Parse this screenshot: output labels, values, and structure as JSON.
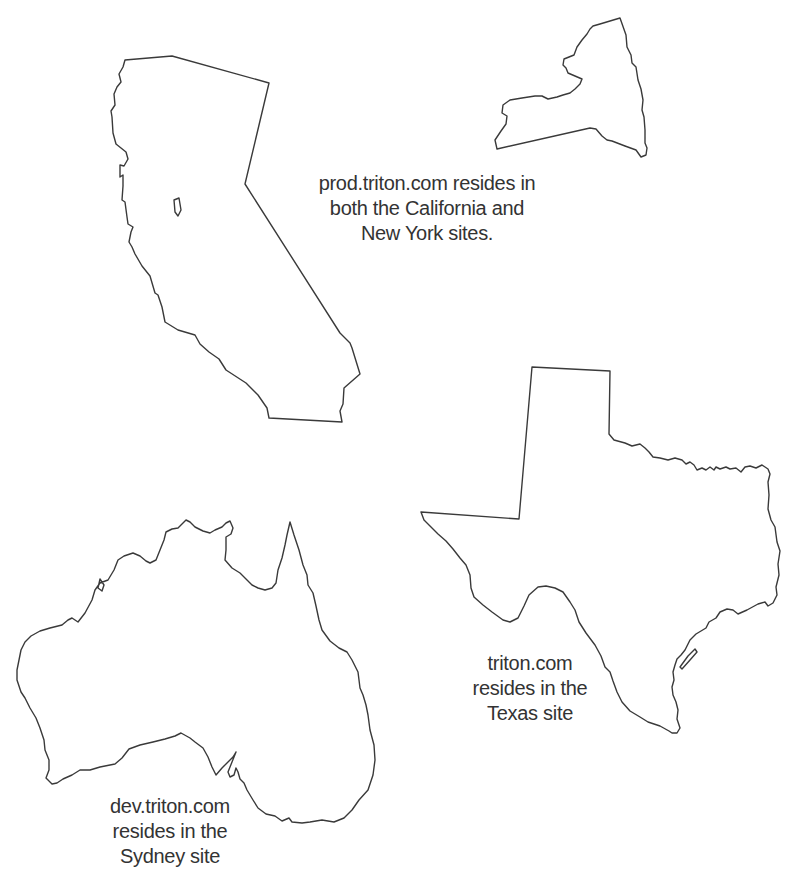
{
  "diagram": {
    "type": "site-map-illustration",
    "regions": [
      {
        "id": "california",
        "name": "California"
      },
      {
        "id": "new-york",
        "name": "New York"
      },
      {
        "id": "texas",
        "name": "Texas"
      },
      {
        "id": "australia",
        "name": "Sydney (Australia)"
      }
    ],
    "labels": {
      "prod": {
        "lines": [
          "prod.triton.com resides in",
          "both the California and",
          "New York sites."
        ]
      },
      "texas": {
        "lines": [
          "triton.com",
          "resides in the",
          "Texas site"
        ]
      },
      "dev": {
        "lines": [
          "dev.triton.com",
          "resides in the",
          "Sydney site"
        ]
      }
    },
    "colors": {
      "outline": "#3a3a3a",
      "text": "#333333",
      "background": "#ffffff"
    }
  }
}
